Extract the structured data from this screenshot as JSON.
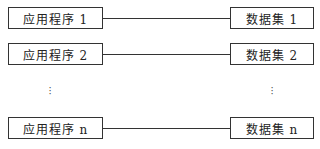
{
  "diagram": {
    "type": "one-to-one mapping",
    "rows": [
      {
        "application": "应用程序 1",
        "dataset": "数据集 1"
      },
      {
        "application": "应用程序 2",
        "dataset": "数据集 2"
      },
      {
        "application": "应用程序 n",
        "dataset": "数据集 n"
      }
    ],
    "ellipsis": "⋮"
  }
}
